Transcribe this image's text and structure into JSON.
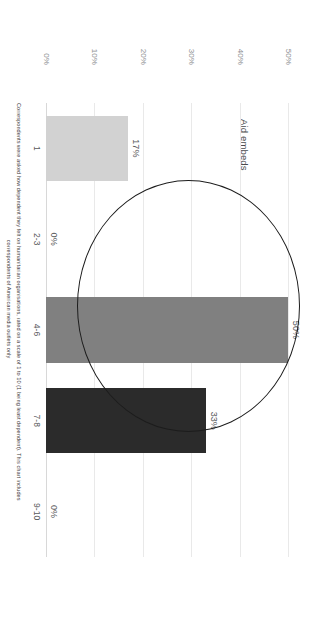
{
  "chart_data": {
    "type": "bar",
    "title": "Aid embeds",
    "xlabel": "",
    "ylabel": "",
    "orientation": "vertical",
    "grid": true,
    "legend": "none",
    "categories": [
      "1",
      "2-3",
      "4-6",
      "7-8",
      "9-10"
    ],
    "values": [
      17,
      0,
      50,
      33,
      0
    ],
    "value_labels": [
      "17%",
      "0%",
      "50%",
      "33%",
      "0%"
    ],
    "bar_colors": [
      "#d2d2d2",
      "#d2d2d2",
      "#808080",
      "#2b2b2b",
      "#2b2b2b"
    ],
    "ylim": [
      0,
      50
    ],
    "yticks": [
      0,
      10,
      20,
      30,
      40,
      50
    ],
    "ytick_labels": [
      "0%",
      "10%",
      "20%",
      "30%",
      "40%",
      "50%"
    ],
    "caption_line1": "Correspondents were asked how dependent they felt on humanitarian organisations, rated on a scale of 1 to 10 (1 being least dependent). This chart includes",
    "caption_line2": "correspondents of American media outlets only",
    "annotation": {
      "shape": "ellipse",
      "encircles": [
        "7-8",
        "9-10"
      ]
    }
  },
  "colors": {
    "gridline": "#e9e9e9",
    "axis_text": "#8d8f91",
    "label_text": "#58595b",
    "annotation_stroke": "#1c1c1c",
    "background": "#ffffff"
  }
}
